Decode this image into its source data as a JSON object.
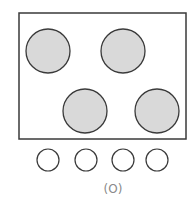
{
  "diagram": {
    "title": "",
    "caption": "(O)",
    "stovetop": {
      "frame": {
        "x": 19,
        "y": 13,
        "width": 167,
        "height": 126,
        "stroke": "#3a3a3a"
      },
      "burners": [
        {
          "id": "top-left",
          "cx": 48,
          "cy": 51,
          "r": 22
        },
        {
          "id": "top-right",
          "cx": 123,
          "cy": 51,
          "r": 22
        },
        {
          "id": "bottom-left",
          "cx": 85,
          "cy": 111,
          "r": 22
        },
        {
          "id": "bottom-right",
          "cx": 157,
          "cy": 111,
          "r": 22
        }
      ],
      "burner_fill": "#d9d9d9",
      "burner_stroke": "#3a3a3a"
    },
    "knobs": [
      {
        "id": "knob-1",
        "cx": 48,
        "cy": 160,
        "r": 11
      },
      {
        "id": "knob-2",
        "cx": 86,
        "cy": 160,
        "r": 11
      },
      {
        "id": "knob-3",
        "cx": 123,
        "cy": 160,
        "r": 11
      },
      {
        "id": "knob-4",
        "cx": 157,
        "cy": 160,
        "r": 11
      }
    ],
    "knob_stroke": "#3a3a3a"
  }
}
